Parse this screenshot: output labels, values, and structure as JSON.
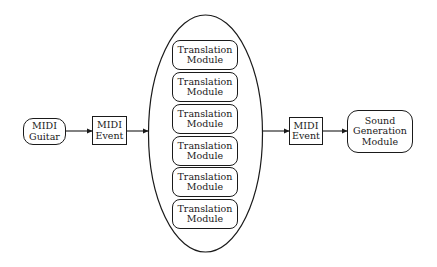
{
  "diagram": {
    "nodes": {
      "midi_guitar": {
        "lines": [
          "MIDI",
          "Guitar"
        ],
        "shape": "rounded-rect"
      },
      "midi_event_in": {
        "lines": [
          "MIDI",
          "Event"
        ],
        "shape": "rect"
      },
      "translation_group": {
        "shape": "ellipse",
        "modules": [
          {
            "lines": [
              "Translation",
              "Module"
            ]
          },
          {
            "lines": [
              "Translation",
              "Module"
            ]
          },
          {
            "lines": [
              "Translation",
              "Module"
            ]
          },
          {
            "lines": [
              "Translation",
              "Module"
            ]
          },
          {
            "lines": [
              "Translation",
              "Module"
            ]
          },
          {
            "lines": [
              "Translation",
              "Module"
            ]
          }
        ]
      },
      "midi_event_out": {
        "lines": [
          "MIDI",
          "Event"
        ],
        "shape": "rect"
      },
      "sound_generation": {
        "lines": [
          "Sound",
          "Generation",
          "Module"
        ],
        "shape": "rounded-rect"
      }
    },
    "edges": [
      {
        "from": "midi_guitar",
        "to": "midi_event_in"
      },
      {
        "from": "midi_event_in",
        "to": "translation_group"
      },
      {
        "from": "translation_group",
        "to": "midi_event_out"
      },
      {
        "from": "midi_event_out",
        "to": "sound_generation"
      }
    ],
    "colors": {
      "stroke": "#1a1a1a",
      "fill": "#ffffff"
    }
  }
}
